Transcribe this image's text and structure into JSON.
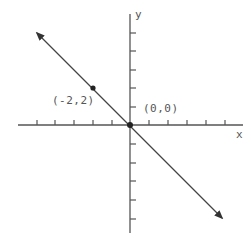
{
  "diagram": {
    "type": "coordinate-plane-line",
    "axis_labels": {
      "x": "x",
      "y": "y"
    },
    "points": [
      {
        "label": "(-2,2)",
        "x": -2,
        "y": 2
      },
      {
        "label": "(0,0)",
        "x": 0,
        "y": 0
      }
    ],
    "line": {
      "equation": "y = -x",
      "slope": -1,
      "intercept": 0
    },
    "x_ticks": [
      -5,
      -4,
      -3,
      -2,
      -1,
      1,
      2,
      3,
      4,
      5
    ],
    "y_ticks": [
      -5,
      -4,
      -3,
      -2,
      -1,
      1,
      2,
      3,
      4,
      5
    ],
    "colors": {
      "axis": "#444444",
      "line": "#444444",
      "point": "#222222",
      "text": "#555555"
    }
  }
}
